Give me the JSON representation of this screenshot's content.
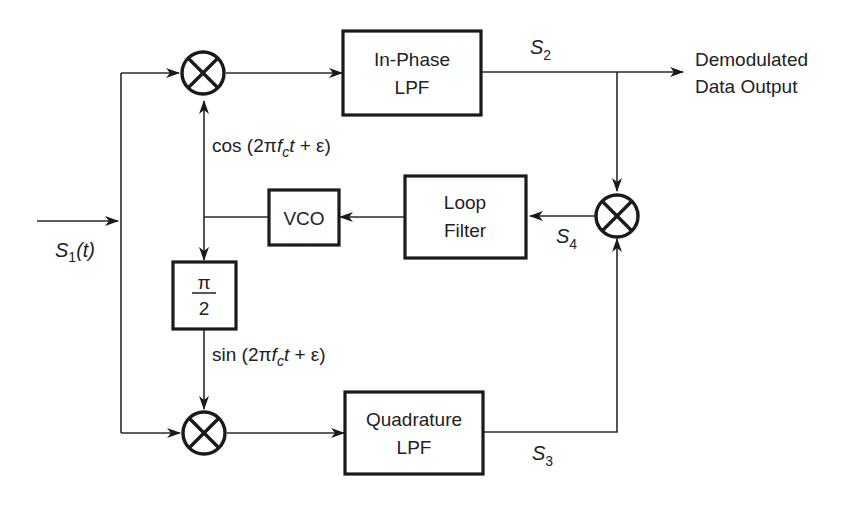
{
  "diagram": {
    "type": "block-diagram",
    "input": {
      "label_base": "S",
      "label_sub": "1",
      "label_suffix": "(t)"
    },
    "blocks": {
      "inphase_lpf": {
        "line1": "In-Phase",
        "line2": "LPF"
      },
      "quadrature_lpf": {
        "line1": "Quadrature",
        "line2": "LPF"
      },
      "loop_filter": {
        "line1": "Loop",
        "line2": "Filter"
      },
      "vco": {
        "label": "VCO"
      },
      "phase_shift": {
        "numerator": "π",
        "denominator": "2"
      }
    },
    "mixers": [
      "top-mixer",
      "bottom-mixer",
      "error-mixer"
    ],
    "signals": {
      "s2": {
        "base": "S",
        "sub": "2"
      },
      "s3": {
        "base": "S",
        "sub": "3"
      },
      "s4": {
        "base": "S",
        "sub": "4"
      },
      "cos": {
        "fn": "cos",
        "open": " (2π",
        "f": "f",
        "fsub": "c",
        "t": "t",
        "rest": " + ε)"
      },
      "sin": {
        "fn": "sin",
        "open": " (2π",
        "f": "f",
        "fsub": "c",
        "t": "t",
        "rest": " + ε)"
      }
    },
    "output": {
      "line1": "Demodulated",
      "line2": "Data Output"
    },
    "colors": {
      "stroke": "#1a1a1a",
      "background": "#ffffff"
    }
  }
}
